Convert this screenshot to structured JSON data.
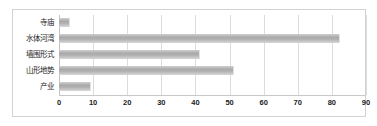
{
  "chart_data": {
    "type": "bar",
    "orientation": "horizontal",
    "title": "",
    "xlabel": "",
    "ylabel": "",
    "categories": [
      "寺庙",
      "水体河湾",
      "墙围形式",
      "山形地势",
      "产业"
    ],
    "values": [
      3,
      82,
      41,
      51,
      9
    ],
    "xlim": [
      0,
      90
    ],
    "xticks": [
      0,
      10,
      20,
      30,
      40,
      50,
      60,
      70,
      80,
      90
    ],
    "xtick_labels": [
      "0",
      "10",
      "20",
      "30",
      "40",
      "50",
      "60",
      "70",
      "80",
      "90"
    ],
    "grid": true,
    "grid_axis": "x",
    "legend": false,
    "bar_color": "#b4b4b4",
    "grid_color": "#dcdcdc",
    "border_color": "#d2d2d2",
    "text_color": "#1c1c1c"
  }
}
